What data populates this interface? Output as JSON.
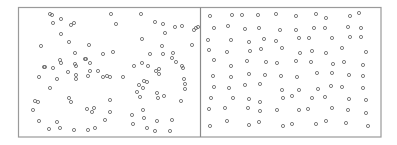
{
  "figure": {
    "frame_color": "#9a9a9a",
    "point_color": "#707070",
    "background": "#ffffff"
  },
  "chart_data": [
    {
      "type": "scatter",
      "title": "",
      "xlabel": "",
      "ylabel": "",
      "grid": false,
      "legend": null,
      "description": "Clustered / random point pattern (left panel)",
      "frame_px": {
        "x0": 18,
        "y0": 7,
        "x1": 200,
        "y1": 137
      },
      "points_px": [
        [
          50,
          14
        ],
        [
          52,
          15
        ],
        [
          61,
          19
        ],
        [
          53,
          23
        ],
        [
          71,
          25
        ],
        [
          74,
          23
        ],
        [
          111,
          14
        ],
        [
          116,
          24
        ],
        [
          61,
          34
        ],
        [
          69,
          42
        ],
        [
          41,
          46
        ],
        [
          89,
          45
        ],
        [
          75,
          53
        ],
        [
          103,
          54
        ],
        [
          113,
          52
        ],
        [
          60,
          60
        ],
        [
          61,
          63
        ],
        [
          85,
          59
        ],
        [
          86,
          59
        ],
        [
          44,
          67
        ],
        [
          45,
          67
        ],
        [
          53,
          68
        ],
        [
          75,
          64
        ],
        [
          76,
          66
        ],
        [
          90,
          63
        ],
        [
          98,
          71
        ],
        [
          103,
          77
        ],
        [
          68,
          72
        ],
        [
          76,
          75
        ],
        [
          76,
          79
        ],
        [
          88,
          76
        ],
        [
          39,
          77
        ],
        [
          57,
          79
        ],
        [
          90,
          71
        ],
        [
          107,
          76
        ],
        [
          123,
          77
        ],
        [
          110,
          77
        ],
        [
          50,
          88
        ],
        [
          69,
          98
        ],
        [
          71,
          102
        ],
        [
          35,
          101
        ],
        [
          38,
          102
        ],
        [
          33,
          110
        ],
        [
          87,
          109
        ],
        [
          94,
          108
        ],
        [
          92,
          112
        ],
        [
          110,
          100
        ],
        [
          110,
          112
        ],
        [
          105,
          120
        ],
        [
          39,
          121
        ],
        [
          57,
          122
        ],
        [
          49,
          129
        ],
        [
          60,
          128
        ],
        [
          74,
          130
        ],
        [
          88,
          130
        ],
        [
          95,
          128
        ],
        [
          141,
          14
        ],
        [
          155,
          22
        ],
        [
          165,
          33
        ],
        [
          175,
          27
        ],
        [
          163,
          24
        ],
        [
          182,
          26
        ],
        [
          142,
          39
        ],
        [
          162,
          46
        ],
        [
          134,
          66
        ],
        [
          142,
          63
        ],
        [
          148,
          66
        ],
        [
          156,
          71
        ],
        [
          159,
          69
        ],
        [
          150,
          54
        ],
        [
          163,
          54
        ],
        [
          173,
          53
        ],
        [
          172,
          58
        ],
        [
          176,
          62
        ],
        [
          183,
          68
        ],
        [
          182,
          66
        ],
        [
          192,
          45
        ],
        [
          194,
          30
        ],
        [
          196,
          28
        ],
        [
          198,
          27
        ],
        [
          144,
          81
        ],
        [
          147,
          82
        ],
        [
          139,
          85
        ],
        [
          137,
          92
        ],
        [
          143,
          88
        ],
        [
          157,
          93
        ],
        [
          159,
          74
        ],
        [
          164,
          96
        ],
        [
          184,
          79
        ],
        [
          185,
          84
        ],
        [
          185,
          89
        ],
        [
          181,
          101
        ],
        [
          140,
          97
        ],
        [
          158,
          98
        ],
        [
          132,
          115
        ],
        [
          143,
          110
        ],
        [
          144,
          118
        ],
        [
          133,
          124
        ],
        [
          157,
          121
        ],
        [
          172,
          120
        ],
        [
          147,
          128
        ],
        [
          155,
          131
        ],
        [
          170,
          131
        ]
      ]
    },
    {
      "type": "scatter",
      "title": "",
      "xlabel": "",
      "ylabel": "",
      "grid": false,
      "legend": null,
      "description": "Regular / dispersed point pattern (right panel)",
      "frame_px": {
        "x0": 200,
        "y0": 7,
        "x1": 381,
        "y1": 137
      },
      "points_px": [
        [
          210,
          16
        ],
        [
          232,
          15
        ],
        [
          242,
          15
        ],
        [
          258,
          15
        ],
        [
          276,
          14
        ],
        [
          296,
          16
        ],
        [
          316,
          14
        ],
        [
          326,
          18
        ],
        [
          350,
          16
        ],
        [
          359,
          13
        ],
        [
          214,
          28
        ],
        [
          228,
          26
        ],
        [
          245,
          29
        ],
        [
          259,
          28
        ],
        [
          280,
          30
        ],
        [
          296,
          30
        ],
        [
          314,
          28
        ],
        [
          325,
          28
        ],
        [
          348,
          27
        ],
        [
          361,
          28
        ],
        [
          208,
          40
        ],
        [
          231,
          40
        ],
        [
          249,
          42
        ],
        [
          264,
          39
        ],
        [
          276,
          41
        ],
        [
          299,
          38
        ],
        [
          309,
          38
        ],
        [
          332,
          38
        ],
        [
          350,
          37
        ],
        [
          361,
          37
        ],
        [
          209,
          50
        ],
        [
          227,
          52
        ],
        [
          250,
          51
        ],
        [
          261,
          49
        ],
        [
          282,
          48
        ],
        [
          300,
          53
        ],
        [
          312,
          51
        ],
        [
          326,
          53
        ],
        [
          342,
          48
        ],
        [
          366,
          52
        ],
        [
          214,
          60
        ],
        [
          231,
          66
        ],
        [
          247,
          61
        ],
        [
          266,
          62
        ],
        [
          277,
          63
        ],
        [
          296,
          61
        ],
        [
          311,
          62
        ],
        [
          333,
          64
        ],
        [
          344,
          62
        ],
        [
          363,
          65
        ],
        [
          213,
          76
        ],
        [
          231,
          77
        ],
        [
          249,
          74
        ],
        [
          265,
          75
        ],
        [
          281,
          76
        ],
        [
          297,
          77
        ],
        [
          317,
          73
        ],
        [
          332,
          73
        ],
        [
          349,
          75
        ],
        [
          363,
          76
        ],
        [
          214,
          87
        ],
        [
          229,
          88
        ],
        [
          245,
          85
        ],
        [
          260,
          84
        ],
        [
          282,
          90
        ],
        [
          299,
          90
        ],
        [
          318,
          89
        ],
        [
          331,
          86
        ],
        [
          342,
          87
        ],
        [
          363,
          88
        ],
        [
          211,
          98
        ],
        [
          233,
          98
        ],
        [
          249,
          99
        ],
        [
          260,
          102
        ],
        [
          283,
          98
        ],
        [
          292,
          96
        ],
        [
          312,
          98
        ],
        [
          325,
          97
        ],
        [
          349,
          99
        ],
        [
          366,
          100
        ],
        [
          209,
          109
        ],
        [
          225,
          108
        ],
        [
          248,
          108
        ],
        [
          260,
          111
        ],
        [
          277,
          110
        ],
        [
          299,
          110
        ],
        [
          308,
          109
        ],
        [
          332,
          108
        ],
        [
          348,
          110
        ],
        [
          366,
          113
        ],
        [
          210,
          126
        ],
        [
          227,
          121
        ],
        [
          249,
          125
        ],
        [
          259,
          122
        ],
        [
          283,
          126
        ],
        [
          292,
          124
        ],
        [
          316,
          124
        ],
        [
          326,
          121
        ],
        [
          346,
          123
        ],
        [
          368,
          126
        ]
      ]
    }
  ]
}
